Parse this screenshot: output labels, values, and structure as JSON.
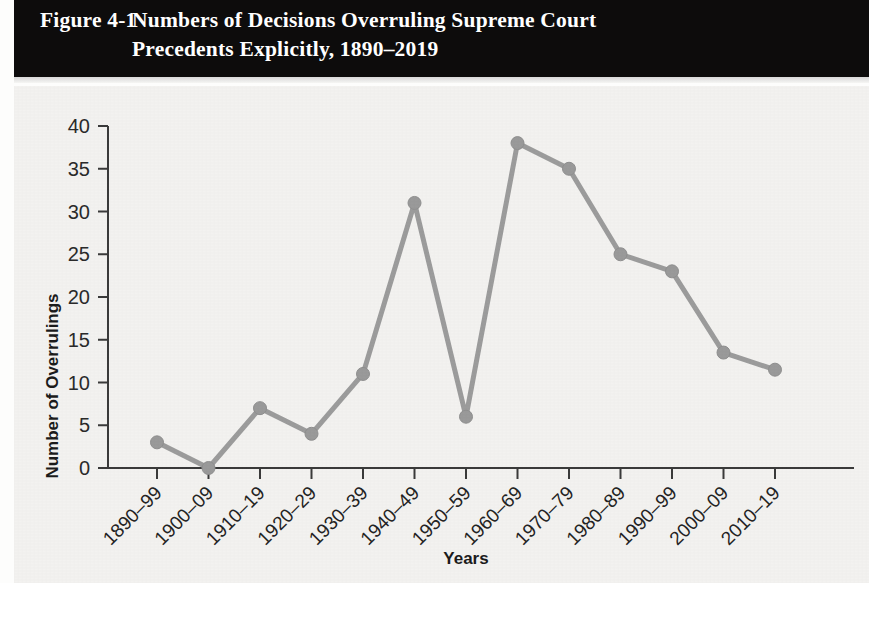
{
  "figure": {
    "number": "Figure 4-1",
    "title_line1": "Numbers of Decisions Overruling Supreme Court",
    "title_line2": "Precedents Explicitly, 1890–2019",
    "banner_color": "#0d0c0c",
    "banner_text_color": "#ffffff"
  },
  "chart_data": {
    "type": "line",
    "title": "Numbers of Decisions Overruling Supreme Court Precedents Explicitly, 1890–2019",
    "xlabel": "Years",
    "ylabel": "Number of Overrulings",
    "categories": [
      "1890–99",
      "1900–09",
      "1910–19",
      "1920–29",
      "1930–39",
      "1940–49",
      "1950–59",
      "1960–69",
      "1970–79",
      "1980–89",
      "1990–99",
      "2000–09",
      "2010–19"
    ],
    "values": [
      3,
      0,
      7,
      4,
      11,
      31,
      6,
      38,
      35,
      25,
      23,
      13.5,
      11.5
    ],
    "ylim": [
      0,
      40
    ],
    "yticks": [
      0,
      5,
      10,
      15,
      20,
      25,
      30,
      35,
      40
    ],
    "ytick_labels": [
      "0",
      "5",
      "10",
      "15",
      "20",
      "25",
      "30",
      "35",
      "40"
    ],
    "grid": false,
    "legend": "none",
    "series_color": "#9a9a9a",
    "marker": "circle",
    "xtick_label_rotation": -45
  }
}
